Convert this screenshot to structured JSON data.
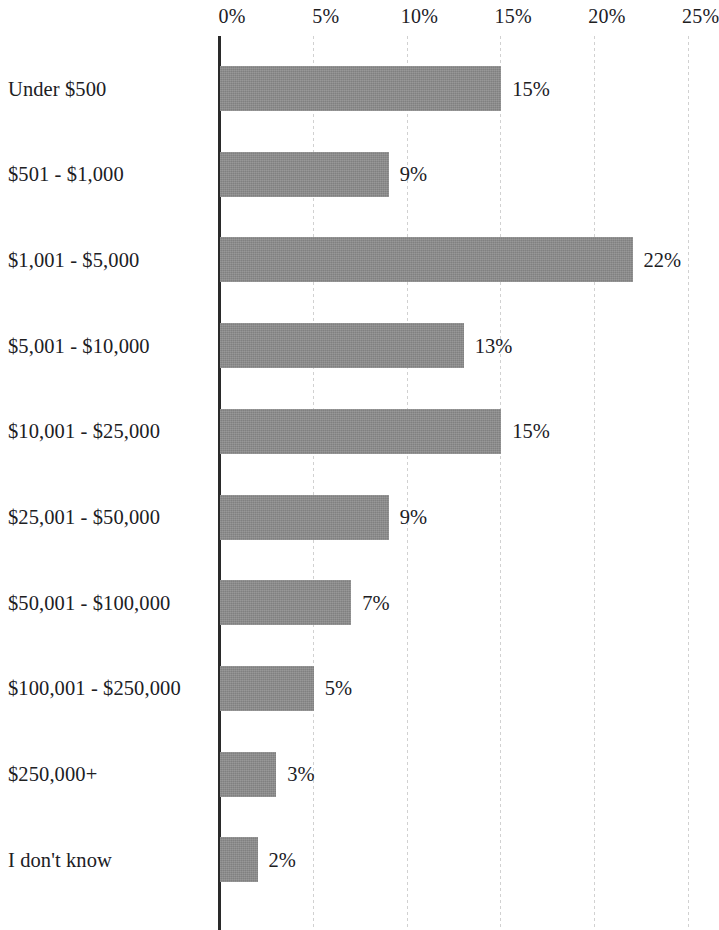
{
  "chart_data": {
    "type": "bar",
    "orientation": "horizontal",
    "title": "",
    "xlabel": "",
    "ylabel": "",
    "xlim": [
      0,
      25
    ],
    "grid": true,
    "legend": false,
    "axis_labels_position": "top",
    "value_label_suffix": "%",
    "bar_color": "#8d8d8d",
    "axis_color": "#2a2a2a",
    "gridline_color": "#c9c9c9",
    "text_color": "#20201f",
    "xticks": [
      0,
      5,
      10,
      15,
      20,
      25
    ],
    "xtick_labels": [
      "0%",
      "5%",
      "10%",
      "15%",
      "20%",
      "25%"
    ],
    "categories": [
      "Under $500",
      "$501 - $1,000",
      "$1,001 - $5,000",
      "$5,001 - $10,000",
      "$10,001 - $25,000",
      "$25,001 - $50,000",
      "$50,001 - $100,000",
      "$100,001 - $250,000",
      "$250,000+",
      "I don't know"
    ],
    "values": [
      15,
      9,
      22,
      13,
      15,
      9,
      7,
      5,
      3,
      2
    ],
    "value_labels": [
      "15%",
      "9%",
      "22%",
      "13%",
      "15%",
      "9%",
      "7%",
      "5%",
      "3%",
      "2%"
    ]
  }
}
